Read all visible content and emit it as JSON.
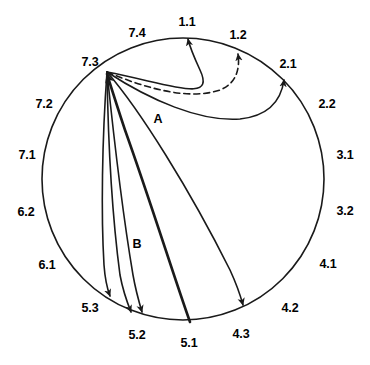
{
  "figure": {
    "type": "circular-arc-diagram",
    "background_color": "#ffffff",
    "stroke_color": "#1a1a1a",
    "circle": {
      "cx": 183,
      "cy": 179,
      "r": 141
    }
  },
  "nodes": [
    {
      "id": "1.1",
      "label": "1.1",
      "label_x": 187,
      "label_y": 22,
      "angle_deg": -88
    },
    {
      "id": "1.2",
      "label": "1.2",
      "label_x": 238,
      "label_y": 35,
      "angle_deg": -68
    },
    {
      "id": "2.1",
      "label": "2.1",
      "label_x": 288,
      "label_y": 64,
      "angle_deg": -47
    },
    {
      "id": "2.2",
      "label": "2.2",
      "label_x": 327,
      "label_y": 104,
      "angle_deg": -29
    },
    {
      "id": "3.1",
      "label": "3.1",
      "label_x": 345,
      "label_y": 155,
      "angle_deg": -10
    },
    {
      "id": "3.2",
      "label": "3.2",
      "label_x": 345,
      "label_y": 211,
      "angle_deg": 11
    },
    {
      "id": "4.1",
      "label": "4.1",
      "label_x": 328,
      "label_y": 264,
      "angle_deg": 31
    },
    {
      "id": "4.2",
      "label": "4.2",
      "label_x": 290,
      "label_y": 308,
      "angle_deg": 50
    },
    {
      "id": "4.3",
      "label": "4.3",
      "label_x": 241,
      "label_y": 334,
      "angle_deg": 67
    },
    {
      "id": "5.1",
      "label": "5.1",
      "label_x": 189,
      "label_y": 343,
      "angle_deg": 87
    },
    {
      "id": "5.2",
      "label": "5.2",
      "label_x": 137,
      "label_y": 335,
      "angle_deg": 105
    },
    {
      "id": "5.3",
      "label": "5.3",
      "label_x": 90,
      "label_y": 308,
      "angle_deg": 124
    },
    {
      "id": "6.1",
      "label": "6.1",
      "label_x": 47,
      "label_y": 265,
      "angle_deg": 145
    },
    {
      "id": "6.2",
      "label": "6.2",
      "label_x": 26,
      "label_y": 212,
      "angle_deg": 167
    },
    {
      "id": "7.1",
      "label": "7.1",
      "label_x": 27,
      "label_y": 155,
      "angle_deg": 189
    },
    {
      "id": "7.2",
      "label": "7.2",
      "label_x": 44,
      "label_y": 104,
      "angle_deg": 210
    },
    {
      "id": "7.3",
      "label": "7.3",
      "label_x": 90,
      "label_y": 62,
      "angle_deg": 230
    },
    {
      "id": "7.4",
      "label": "7.4",
      "label_x": 137,
      "label_y": 33,
      "angle_deg": 249
    }
  ],
  "arc_labels": [
    {
      "id": "A",
      "label": "A",
      "x": 158,
      "y": 119
    },
    {
      "id": "B",
      "label": "B",
      "x": 137,
      "y": 244
    }
  ],
  "arcs": [
    {
      "id": "arc-7_3-to-1_1",
      "from": "7.3",
      "to": "1.1",
      "style": "solid",
      "stroke_width": 1.6,
      "arrowhead": "to",
      "path": "M 107,72 C 170,84 216,104 200,70 C 194,57 190,48 188,39"
    },
    {
      "id": "arc-7_3-to-1_2",
      "from": "7.3",
      "to": "1.2",
      "style": "dashed",
      "stroke_width": 1.6,
      "arrowhead": "to",
      "path": "M 107,72 C 150,90 190,100 220,90 C 237,83 240,68 238,54"
    },
    {
      "id": "arc-7_3-to-2_1-labeled-A",
      "from": "7.3",
      "to": "2.1",
      "label": "A",
      "style": "solid",
      "stroke_width": 1.6,
      "arrowhead": "to",
      "path": "M 107,72 C 150,100 200,122 240,119 C 268,116 281,101 284,80"
    },
    {
      "id": "arc-7_3-to-4_3",
      "from": "7.3",
      "to": "4.3",
      "style": "solid",
      "stroke_width": 1.6,
      "arrowhead": "to",
      "path": "M 107,72 C 140,110 190,190 230,270 C 236,283 240,294 243,305"
    },
    {
      "id": "arc-5_1-to-7_3",
      "from": "5.1",
      "to": "7.3",
      "style": "solid",
      "stroke_width": 2.6,
      "arrowhead": "to",
      "path": "M 190,322 C 175,280 150,200 125,130 C 118,109 112,90 107,74"
    },
    {
      "id": "arc-7_3-to-5_2-labeled-B",
      "from": "7.3",
      "to": "5.2",
      "label": "B",
      "style": "solid",
      "stroke_width": 1.6,
      "arrowhead": "to",
      "path": "M 107,72 C 113,130 122,210 133,275 C 136,292 139,302 142,312"
    },
    {
      "id": "arc-7_3-to-5_2b",
      "from": "7.3",
      "to": "5.2",
      "style": "solid",
      "stroke_width": 1.6,
      "arrowhead": "to",
      "path": "M 107,72 C 108,135 112,215 120,275 C 123,291 127,302 131,312"
    },
    {
      "id": "arc-7_3-to-5_3",
      "from": "7.3",
      "to": "5.3",
      "style": "solid",
      "stroke_width": 1.6,
      "arrowhead": "to",
      "path": "M 107,72 C 102,140 101,215 104,265 C 105,279 107,288 110,296"
    }
  ]
}
